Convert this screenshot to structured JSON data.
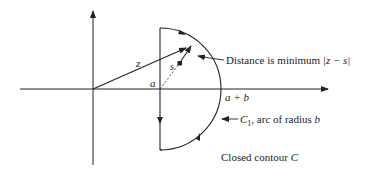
{
  "diagram": {
    "type": "complex-plane contour",
    "labels": {
      "z": "z",
      "s": "s",
      "a": "a",
      "a_plus_b": "a + b",
      "distance_prefix": "Distance is minimum ",
      "distance_expr": "|z − s|",
      "c1_name": "C",
      "c1_sub": "1",
      "c1_desc": ", arc of radius ",
      "c1_b": "b",
      "closed_prefix": "Closed contour ",
      "closed_c": "C"
    },
    "geometry": {
      "origin": [
        93,
        89
      ],
      "contour_line_x": 160,
      "arc_center": [
        160,
        89
      ],
      "arc_radius": 62,
      "z_point": [
        187,
        48
      ],
      "s_point": [
        180,
        63
      ]
    },
    "colors": {
      "stroke": "#222222",
      "background": "#ffffff"
    }
  }
}
